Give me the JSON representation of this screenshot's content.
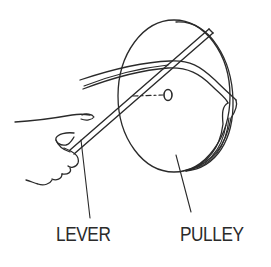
{
  "figure": {
    "labels": {
      "lever": "LEVER",
      "pulley": "PULLEY"
    },
    "colors": {
      "line": "#2a2a2a",
      "background": "#ffffff"
    }
  }
}
